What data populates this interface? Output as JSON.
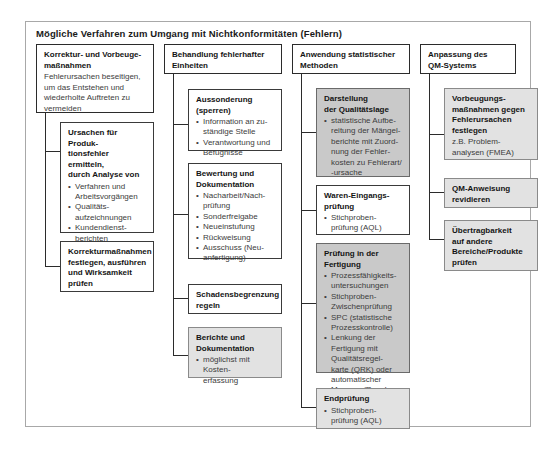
{
  "diagram": {
    "title": "Mögliche Verfahren zum Umgang mit Nichtkonformitäten (Fehlern)",
    "type": "tree-diagram",
    "colors": {
      "frame": "#a8a8a8",
      "box_border": "#3a3a3a",
      "fill_mid_gray": "#c9c9c9",
      "fill_light_gray": "#e2e2e2",
      "text": "#141414"
    }
  },
  "columns": [
    {
      "id": "korrektur-vorbeugemassnahmen",
      "head": {
        "title": "Korrektur- und Vorbeuge-\nmaßnahmen",
        "sub": "Fehlerursachen beseitigen,\num das Entstehen und\nwiederholte Auftreten zu\nvermeiden"
      },
      "children": [
        {
          "id": "ursachen-produktionsfehler",
          "title": "Ursachen für Produk-\ntionsfehler ermitteln,\ndurch Analyse von",
          "bullets": [
            "Verfahren und\nArbeitsvorgängen",
            "Qualitäts-\naufzeichnungen",
            "Kundendienst-\nberichten",
            "Mängelberichten",
            "Kunden-\nbeanstandungen"
          ],
          "fill": "none"
        },
        {
          "id": "korrekturmassnahmen-festlegen",
          "title": "Korrekturmaßnahmen\nfestlegen, ausführen\nund Wirksamkeit\nprüfen",
          "bullets": [],
          "fill": "none"
        }
      ]
    },
    {
      "id": "behandlung-fehlerhafter-einheiten",
      "head": {
        "title": "Behandlung fehlerhafter\nEinheiten",
        "sub": ""
      },
      "children": [
        {
          "id": "aussonderung-sperren",
          "title": "Aussonderung\n(sperren)",
          "bullets": [
            "Information an zu-\nständige Stelle",
            "Verantwortung und\nBefugnisse"
          ],
          "fill": "none"
        },
        {
          "id": "bewertung-dokumentation",
          "title": "Bewertung und\nDokumentation",
          "bullets": [
            "Nacharbeit/Nach-\nprüfung",
            "Sonderfreigabe",
            "Neueinstufung",
            "Rückweisung",
            "Ausschuss (Neu-\nanfertigung)"
          ],
          "fill": "none"
        },
        {
          "id": "schadensbegrenzung-regeln",
          "title": "Schadensbegrenzung\nregeln",
          "bullets": [],
          "fill": "none"
        },
        {
          "id": "berichte-dokumentation",
          "title": "Berichte und\nDokumentation",
          "bullets": [
            "möglichst mit Kosten-\nerfassung"
          ],
          "fill": "light"
        }
      ]
    },
    {
      "id": "anwendung-statistischer-methoden",
      "head": {
        "title": "Anwendung statistischer\nMethoden",
        "sub": ""
      },
      "children": [
        {
          "id": "darstellung-qualitaetslage",
          "title": "Darstellung\nder Qualitätslage",
          "bullets": [
            "statistische Aufbe-\nreitung der Mängel-\nberichte mit Zuord-\nnung der Fehler-\nkosten zu Fehlerart/\n-ursache"
          ],
          "fill": "mid"
        },
        {
          "id": "waren-eingangspruefung",
          "title": "Waren-Eingangs-\nprüfung",
          "bullets": [
            "Stichproben-\nprüfung (AQL)"
          ],
          "fill": "none"
        },
        {
          "id": "pruefung-in-der-fertigung",
          "title": "Prüfung in der\nFertigung",
          "bullets": [
            "Prozessfähigkeits-\nuntersuchungen",
            "Stichproben-\nZwischenprüfung",
            "SPC (statistische\nProzesskontrolle)",
            "Lenkung der\nFertigung mit\nQualitätsregel-\nkarte (QRK) oder\nautomatischer\nMessung/Regelung"
          ],
          "fill": "mid"
        },
        {
          "id": "endpruefung",
          "title": "Endprüfung",
          "bullets": [
            "Stichproben-\nprüfung (AQL)"
          ],
          "fill": "light"
        }
      ]
    },
    {
      "id": "anpassung-qm-systems",
      "head": {
        "title": "Anpassung des\nQM-Systems",
        "sub": ""
      },
      "children": [
        {
          "id": "vorbeugungsmassnahmen",
          "title": "Vorbeugungs-\nmaßnahmen gegen\nFehlerursachen\nfestlegen",
          "sub": "z.B. Problem-\nanalysen (FMEA)",
          "bullets": [],
          "fill": "light"
        },
        {
          "id": "qm-anweisung-revidieren",
          "title": "QM-Anweisung\nrevidieren",
          "bullets": [],
          "fill": "light"
        },
        {
          "id": "uebertragbarkeit-pruefen",
          "title": "Übertragbarkeit\nauf andere\nBereiche/Produkte\nprüfen",
          "bullets": [],
          "fill": "light"
        }
      ]
    }
  ]
}
